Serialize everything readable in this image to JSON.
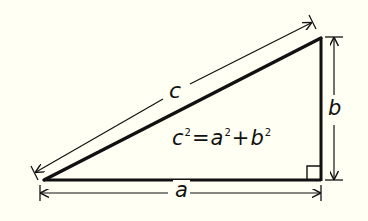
{
  "diagram": {
    "labels": {
      "hypotenuse": "c",
      "vertical_leg": "b",
      "horizontal_leg": "a"
    },
    "equation": {
      "lhs_var": "c",
      "lhs_exp": "2",
      "equals": "=",
      "term1_var": "a",
      "term1_exp": "2",
      "plus": "+",
      "term2_var": "b",
      "term2_exp": "2"
    },
    "vertices": {
      "bottom_left": [
        44,
        180
      ],
      "bottom_right": [
        321,
        180
      ],
      "top_right": [
        321,
        38
      ]
    },
    "right_angle_marker": "bottom-right",
    "colors": {
      "background": "#fffff4",
      "ink": "#111111"
    }
  }
}
